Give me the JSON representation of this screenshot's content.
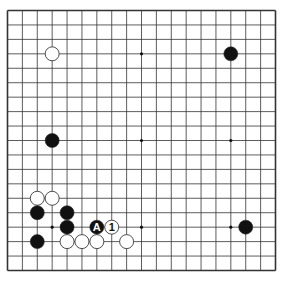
{
  "diagram": {
    "type": "go-board",
    "size": 19,
    "colors": {
      "background": "#ffffff",
      "line": "#333333",
      "black": "#111111",
      "white": "#ffffff",
      "star": "#111111"
    },
    "star_points": [
      [
        3,
        3
      ],
      [
        9,
        3
      ],
      [
        15,
        3
      ],
      [
        3,
        9
      ],
      [
        9,
        9
      ],
      [
        15,
        9
      ],
      [
        3,
        15
      ],
      [
        9,
        15
      ],
      [
        15,
        15
      ]
    ],
    "stones": [
      {
        "col": 3,
        "row": 3,
        "color": "white"
      },
      {
        "col": 15,
        "row": 3,
        "color": "black"
      },
      {
        "col": 3,
        "row": 9,
        "color": "black"
      },
      {
        "col": 2,
        "row": 13,
        "color": "white"
      },
      {
        "col": 3,
        "row": 13,
        "color": "white"
      },
      {
        "col": 2,
        "row": 14,
        "color": "black"
      },
      {
        "col": 4,
        "row": 14,
        "color": "black"
      },
      {
        "col": 4,
        "row": 15,
        "color": "black"
      },
      {
        "col": 6,
        "row": 15,
        "color": "black",
        "label": "A"
      },
      {
        "col": 7,
        "row": 15,
        "color": "white",
        "label": "1"
      },
      {
        "col": 2,
        "row": 16,
        "color": "black"
      },
      {
        "col": 4,
        "row": 16,
        "color": "white"
      },
      {
        "col": 5,
        "row": 16,
        "color": "white"
      },
      {
        "col": 6,
        "row": 16,
        "color": "white"
      },
      {
        "col": 8,
        "row": 16,
        "color": "white"
      },
      {
        "col": 16,
        "row": 15,
        "color": "black"
      }
    ]
  }
}
